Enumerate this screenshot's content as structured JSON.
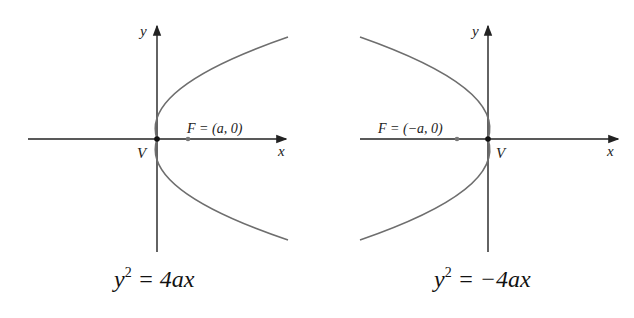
{
  "colors": {
    "axis": "#222222",
    "curve": "#6e6e6e",
    "focus": "#777777",
    "vertex": "#111111"
  },
  "left": {
    "y_label": "y",
    "x_label": "x",
    "vertex_label": "V",
    "focus_label": "F = (a, 0)",
    "equation": {
      "base": "y",
      "exp": "2",
      "rhs": " = 4ax"
    }
  },
  "right": {
    "y_label": "y",
    "x_label": "x",
    "vertex_label": "V",
    "focus_label": "F = (−a, 0)",
    "equation": {
      "base": "y",
      "exp": "2",
      "rhs": " = −4ax"
    }
  }
}
